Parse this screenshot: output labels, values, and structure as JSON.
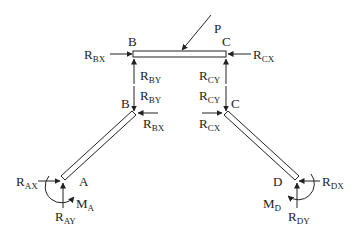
{
  "diagram": {
    "type": "free-body-diagram",
    "members": [
      {
        "id": "BC",
        "label_start": "B",
        "label_end": "C"
      },
      {
        "id": "AB",
        "label_start": "A",
        "label_end": "B"
      },
      {
        "id": "DC",
        "label_start": "D",
        "label_end": "C"
      }
    ],
    "labels": {
      "P": "P",
      "B_top": "B",
      "C_top": "C",
      "B_mid": "B",
      "C_mid": "C",
      "A": "A",
      "D": "D"
    },
    "forces": {
      "RBX_top": {
        "main": "R",
        "sub": "BX"
      },
      "RCX_top": {
        "main": "R",
        "sub": "CX"
      },
      "RBY_top": {
        "main": "R",
        "sub": "BY"
      },
      "RBY_mid": {
        "main": "R",
        "sub": "BY"
      },
      "RCY_top": {
        "main": "R",
        "sub": "CY"
      },
      "RCY_mid": {
        "main": "R",
        "sub": "CY"
      },
      "RBX_mid": {
        "main": "R",
        "sub": "BX"
      },
      "RCX_mid": {
        "main": "R",
        "sub": "CX"
      },
      "RAX": {
        "main": "R",
        "sub": "AX"
      },
      "RAY": {
        "main": "R",
        "sub": "AY"
      },
      "MA": {
        "main": "M",
        "sub": "A"
      },
      "RDX": {
        "main": "R",
        "sub": "DX"
      },
      "RDY": {
        "main": "R",
        "sub": "DY"
      },
      "MD": {
        "main": "M",
        "sub": "D"
      }
    },
    "colors": {
      "stroke": "#222222",
      "background": "#ffffff"
    }
  }
}
